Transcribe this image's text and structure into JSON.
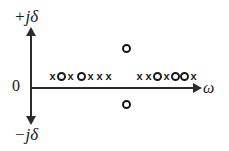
{
  "figure": {
    "title": "",
    "axes": {
      "vertical_top_label": "+jδ",
      "vertical_bottom_label": "−jδ",
      "horizontal_label": "ω",
      "origin_label": "0"
    },
    "colors": {
      "axis": "#2b2b2b",
      "marker": "#1a1a1a",
      "background": "#ffffff"
    }
  },
  "chart_data": {
    "type": "scatter",
    "title": "",
    "xlabel": "ω",
    "ylabel": "jδ",
    "grid": false,
    "legend": null,
    "axis_style": "crossing-arrows",
    "marker_glyphs": {
      "pole": "x",
      "zero": "o"
    },
    "on_axis_clusters": [
      {
        "name": "cluster-left",
        "sequence": [
          "x",
          "o",
          "x"
        ]
      },
      {
        "name": "cluster-middle",
        "sequence": [
          "o",
          "x",
          "x",
          "x"
        ]
      },
      {
        "name": "cluster-right",
        "sequence": [
          "x",
          "x",
          "o",
          "x",
          "o",
          "o",
          "x"
        ]
      }
    ],
    "off_axis_markers": [
      {
        "name": "zero-upper",
        "glyph": "o",
        "side": "upper-half-plane"
      },
      {
        "name": "zero-lower",
        "glyph": "o",
        "side": "lower-half-plane"
      }
    ],
    "counts": {
      "on_axis_poles": 8,
      "on_axis_zeros": 6,
      "off_axis_zeros": 2
    }
  }
}
